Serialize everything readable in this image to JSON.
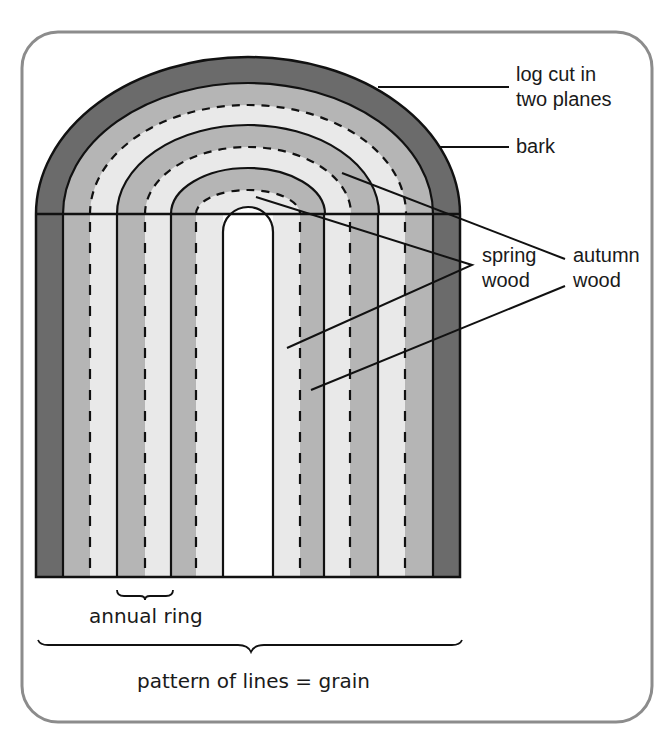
{
  "diagram": {
    "colors": {
      "frame": "#8c8c8c",
      "bark": "#6b6b6b",
      "autumn_wood": "#b5b5b5",
      "spring_wood": "#e9e9e9",
      "pith_slot": "#ffffff",
      "line": "#111111"
    },
    "labels": {
      "log_cut_line1": "log cut in",
      "log_cut_line2": "two planes",
      "bark": "bark",
      "spring_line1": "spring",
      "spring_line2": "wood",
      "autumn_line1": "autumn",
      "autumn_line2": "wood",
      "annual_ring": "annual ring",
      "grain_caption": "pattern of lines = grain"
    },
    "components": [
      {
        "name": "bark",
        "description": "outermost dark band"
      },
      {
        "name": "autumn wood",
        "description": "medium grey bands bounded by solid lines"
      },
      {
        "name": "spring wood",
        "description": "light grey bands, dashed line boundaries"
      },
      {
        "name": "annual ring",
        "description": "one autumn + one spring band"
      },
      {
        "name": "grain",
        "description": "pattern of lines across the cut surface"
      }
    ]
  }
}
